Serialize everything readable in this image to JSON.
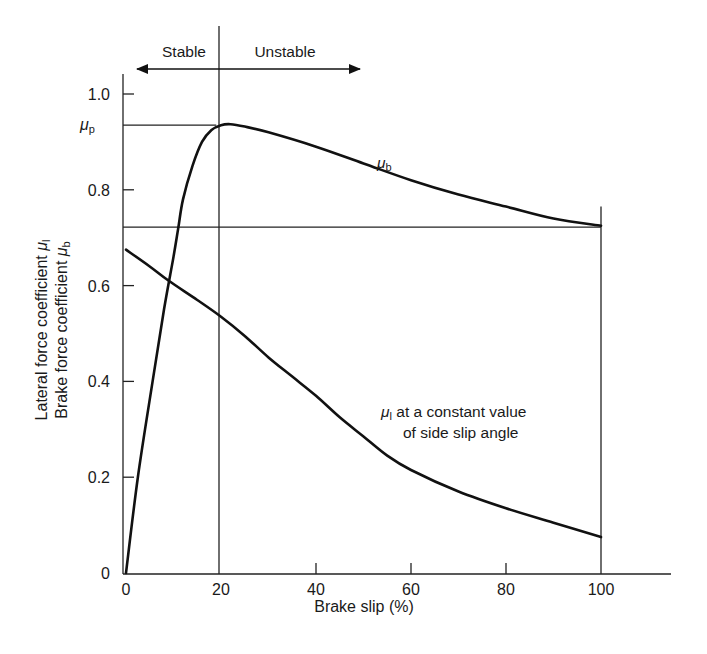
{
  "chart_data": {
    "type": "line",
    "title": "",
    "xlabel": "Brake slip (%)",
    "ylabel_line1": "Lateral force coefficient μ",
    "ylabel_line1_sub": "l",
    "ylabel_line2": "Brake force coefficient μ",
    "ylabel_line2_sub": "b",
    "xlim": [
      0,
      115
    ],
    "ylim": [
      0,
      1.05
    ],
    "x_ticks": [
      0,
      20,
      40,
      60,
      80,
      100
    ],
    "x_tick_labels": [
      "0",
      "20",
      "40",
      "60",
      "80",
      "100"
    ],
    "y_ticks": [
      0,
      0.2,
      0.4,
      0.6,
      0.8,
      1.0
    ],
    "y_tick_labels": [
      "0",
      "0.2",
      "0.4",
      "0.6",
      "0.8",
      "1.0"
    ],
    "grid": false,
    "series": [
      {
        "name": "μb (brake force coefficient)",
        "label_main": "μ",
        "label_sub": "b",
        "x": [
          0,
          2.5,
          5.6,
          8,
          10,
          11,
          12,
          14,
          16,
          18,
          20,
          22,
          25,
          30,
          40,
          50,
          60,
          70,
          80,
          90,
          100
        ],
        "y": [
          0,
          0.2,
          0.4,
          0.55,
          0.66,
          0.72,
          0.78,
          0.85,
          0.9,
          0.925,
          0.935,
          0.937,
          0.932,
          0.92,
          0.89,
          0.855,
          0.82,
          0.79,
          0.765,
          0.74,
          0.725
        ]
      },
      {
        "name": "μl (lateral force coefficient) at a constant value of side slip angle",
        "label_main": "μ",
        "label_sub": "l",
        "label_rest": " at a constant value",
        "label_line2": "of side slip angle",
        "x": [
          0,
          5,
          9,
          15,
          20,
          25,
          30,
          35,
          40,
          45,
          50,
          55,
          60,
          70,
          80,
          90,
          100
        ],
        "y": [
          0.675,
          0.64,
          0.61,
          0.57,
          0.535,
          0.495,
          0.45,
          0.41,
          0.37,
          0.325,
          0.285,
          0.245,
          0.215,
          0.17,
          0.135,
          0.105,
          0.075
        ]
      }
    ],
    "reference_lines": {
      "mu_p": {
        "label_main": "μ",
        "label_sub": "p",
        "value": 0.935,
        "x_end": 19
      },
      "horizontal_mu_b_at_100": {
        "value": 0.722,
        "x_start": 0,
        "x_end": 100
      },
      "vertical_20": {
        "x": 20
      },
      "vertical_100": {
        "x": 100,
        "y_start": 0,
        "y_end": 0.765
      }
    },
    "annotations": [
      {
        "text": "Stable",
        "direction": "left"
      },
      {
        "text": "Unstable",
        "direction": "right"
      }
    ]
  },
  "labels": {
    "stable": "Stable",
    "unstable": "Unstable",
    "mu": "μ",
    "sub_p": "p",
    "sub_b": "b",
    "sub_l": "l",
    "mu_l_rest": " at a constant value",
    "mu_l_line2": "of side slip angle",
    "xlabel": "Brake slip (%)",
    "ylabel1": "Lateral force coefficient ",
    "ylabel2": "Brake force coefficient "
  }
}
